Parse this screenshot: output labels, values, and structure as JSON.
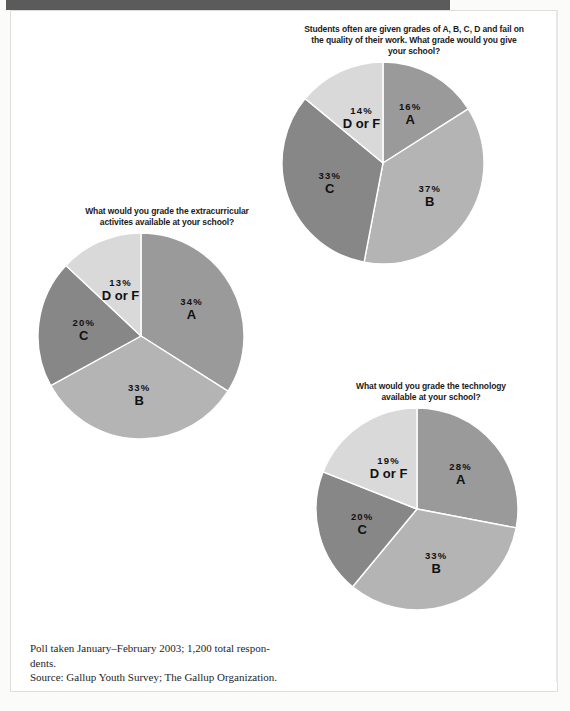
{
  "page": {
    "footnote_line1": "Poll taken January–February 2003; 1,200 total respon-\ndents.",
    "footnote_line2": "Source: Gallup Youth Survey; The Gallup Organization."
  },
  "colors": {
    "slice_a": "#9a9a9a",
    "slice_b": "#b4b4b4",
    "slice_c": "#878787",
    "slice_df": "#d9d9d9",
    "slice_edge": "#ffffff",
    "top_rule": "#5b5b5b",
    "text": "#111111"
  },
  "chart_data": [
    {
      "id": "extracurricular",
      "type": "pie",
      "title": "What would you grade the extracurricular\nactivites available at your school?",
      "categories": [
        "A",
        "B",
        "C",
        "D or F"
      ],
      "values": [
        34,
        33,
        20,
        13
      ],
      "labels": [
        "34%",
        "33%",
        "20%",
        "13%"
      ],
      "colors": [
        "#9a9a9a",
        "#b4b4b4",
        "#878787",
        "#d9d9d9"
      ],
      "start_angle": 0,
      "direction": "clockwise",
      "units": "percent",
      "radius": 103,
      "legend": "inside-slices"
    },
    {
      "id": "overall",
      "type": "pie",
      "title": "Students often are given grades of A, B, C, D and fail on\nthe quality of their work. What grade would you give\nyour school?",
      "categories": [
        "A",
        "B",
        "C",
        "D or F"
      ],
      "values": [
        16,
        37,
        33,
        14
      ],
      "labels": [
        "16%",
        "37%",
        "33%",
        "14%"
      ],
      "colors": [
        "#9a9a9a",
        "#b4b4b4",
        "#878787",
        "#d9d9d9"
      ],
      "start_angle": 0,
      "direction": "clockwise",
      "units": "percent",
      "radius": 101,
      "legend": "inside-slices"
    },
    {
      "id": "technology",
      "type": "pie",
      "title": "What would you grade the technology\navailable at your school?",
      "categories": [
        "A",
        "B",
        "C",
        "D or F"
      ],
      "values": [
        28,
        33,
        20,
        19
      ],
      "labels": [
        "28%",
        "33%",
        "20%",
        "19%"
      ],
      "colors": [
        "#9a9a9a",
        "#b4b4b4",
        "#878787",
        "#d9d9d9"
      ],
      "start_angle": 0,
      "direction": "clockwise",
      "units": "percent",
      "radius": 101,
      "legend": "inside-slices"
    }
  ]
}
